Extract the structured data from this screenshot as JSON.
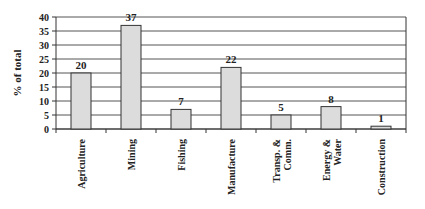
{
  "chart_data": {
    "type": "bar",
    "title": "",
    "xlabel": "",
    "ylabel": "% of total",
    "ylim": [
      0,
      40
    ],
    "yticks": [
      0,
      5,
      10,
      15,
      20,
      25,
      30,
      35,
      40
    ],
    "grid": true,
    "legend": null,
    "categories": [
      "Agriculture",
      "Mining",
      "Fishing",
      "Manufacture",
      "Transp. & Comm.",
      "Energy & Water",
      "Construction"
    ],
    "category_lines": [
      [
        "Agriculture"
      ],
      [
        "Mining"
      ],
      [
        "Fishing"
      ],
      [
        "Manufacture"
      ],
      [
        "Transp. &",
        "Comm."
      ],
      [
        "Energy &",
        "Water"
      ],
      [
        "Construction"
      ]
    ],
    "values": [
      20,
      37,
      7,
      22,
      5,
      8,
      1
    ],
    "data_labels": [
      "20",
      "37",
      "7",
      "22",
      "5",
      "8",
      "1"
    ],
    "colors": {
      "bar_fill": "#dcdcdc",
      "bar_stroke": "#333333",
      "grid": "#555555",
      "axis": "#333333"
    }
  }
}
